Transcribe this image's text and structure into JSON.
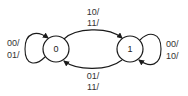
{
  "diagram": {
    "type": "state-transition",
    "colors": {
      "stroke": "#1a1a1a",
      "text": "#333333",
      "background": "#ffffff"
    },
    "states": [
      {
        "id": "s0",
        "label": "0"
      },
      {
        "id": "s1",
        "label": "1"
      }
    ],
    "transitions": [
      {
        "from": "0",
        "to": "1",
        "labels": [
          "10/",
          "11/"
        ]
      },
      {
        "from": "1",
        "to": "0",
        "labels": [
          "01/",
          "11/"
        ]
      },
      {
        "from": "0",
        "to": "0",
        "labels": [
          "00/",
          "01/"
        ]
      },
      {
        "from": "1",
        "to": "1",
        "labels": [
          "00/",
          "10/"
        ]
      }
    ]
  }
}
